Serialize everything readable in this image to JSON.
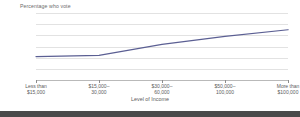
{
  "chart_data": {
    "type": "line",
    "title": "Percentage who vote",
    "xlabel": "Level of Income",
    "ylabel": "",
    "categories": [
      "Less than $15,000",
      "$15,000–30,000",
      "$30,000–60,000",
      "$50,000–100,000",
      "More than $100,000"
    ],
    "category_lines": [
      [
        "Less than",
        "$15,000"
      ],
      [
        "$15,000–",
        "30,000"
      ],
      [
        "$30,000–",
        "60,000"
      ],
      [
        "$50,000–",
        "100,000"
      ],
      [
        "More than",
        "$100,000"
      ]
    ],
    "values": [
      51,
      52,
      62,
      69,
      75
    ],
    "series": [
      {
        "name": "Percentage who vote",
        "values": [
          51,
          52,
          62,
          69,
          75
        ]
      }
    ],
    "ylim": [
      30,
      90
    ],
    "ytick_values": [
      90,
      80,
      70,
      60,
      50,
      40,
      30
    ],
    "ytick_labels": [
      "90%",
      "80%",
      "70%",
      "60%",
      "50%",
      "40%",
      "30%"
    ],
    "grid": true,
    "legend": "none",
    "line_color": "#5b5f93",
    "grid_color": "#e2e2e2",
    "axis_color": "#b9b9b9",
    "text_color": "#6b6b6b",
    "background_color": "#ffffff"
  }
}
